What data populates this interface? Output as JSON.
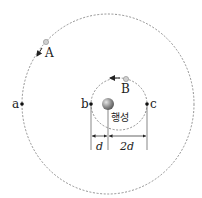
{
  "diagram": {
    "outer_orbit": {
      "cx": 108,
      "cy": 104,
      "rx": 86,
      "ry": 90
    },
    "inner_orbit": {
      "cx": 119,
      "cy": 104,
      "rx": 28,
      "ry": 26
    },
    "planet": {
      "label": "행성",
      "cx": 108,
      "cy": 104
    },
    "satellites": [
      {
        "label": "A",
        "cx": 46,
        "cy": 42,
        "direction": "counterclockwise"
      },
      {
        "label": "B",
        "cx": 125,
        "cy": 79,
        "direction": "counterclockwise"
      }
    ],
    "points": [
      {
        "label": "a",
        "cx": 22,
        "cy": 104
      },
      {
        "label": "b",
        "cx": 91,
        "cy": 104
      },
      {
        "label": "c",
        "cx": 147,
        "cy": 104
      }
    ],
    "dimensions": [
      {
        "label": "d",
        "from": "b",
        "to": "planet"
      },
      {
        "label": "2d",
        "from": "planet",
        "to": "c"
      }
    ],
    "colors": {
      "line": "#555555",
      "orbit": "#777777",
      "planet": "#8a8a8a",
      "satellite": "#bdbdbd"
    }
  }
}
